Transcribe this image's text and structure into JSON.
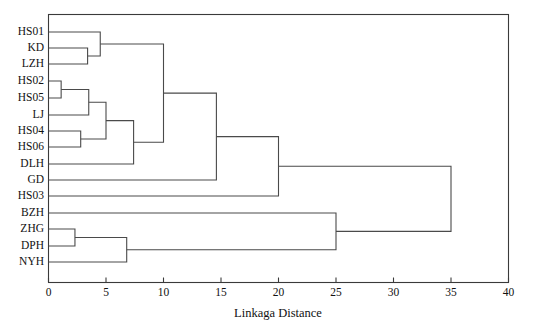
{
  "chart_data": {
    "type": "dendrogram",
    "title": "",
    "xlabel": "Linkaga Distance",
    "ylabel": "",
    "xlim": [
      0,
      40
    ],
    "xticks": [
      0,
      5,
      10,
      15,
      20,
      25,
      30,
      35,
      40
    ],
    "xtick_labels": [
      "0",
      "5",
      "10",
      "15",
      "20",
      "25",
      "30",
      "35",
      "40"
    ],
    "grid": false,
    "legend": null,
    "orientation": "horizontal",
    "leaves": [
      "HS01",
      "KD",
      "LZH",
      "HS02",
      "HS05",
      "LJ",
      "HS04",
      "HS06",
      "DLH",
      "GD",
      "HS03",
      "BZH",
      "ZHG",
      "DPH",
      "NYH"
    ],
    "merges": [
      {
        "id": "m1",
        "children": [
          "KD",
          "LZH"
        ],
        "distance": 3.4
      },
      {
        "id": "m2",
        "children": [
          "HS01",
          "m1"
        ],
        "distance": 4.5
      },
      {
        "id": "m3",
        "children": [
          "HS02",
          "HS05"
        ],
        "distance": 1.1
      },
      {
        "id": "m4",
        "children": [
          "m3",
          "LJ"
        ],
        "distance": 3.5
      },
      {
        "id": "m5",
        "children": [
          "HS04",
          "HS06"
        ],
        "distance": 2.8
      },
      {
        "id": "m6",
        "children": [
          "m4",
          "m5"
        ],
        "distance": 5.0
      },
      {
        "id": "m7",
        "children": [
          "m6",
          "DLH"
        ],
        "distance": 7.4
      },
      {
        "id": "m8",
        "children": [
          "m2",
          "m7"
        ],
        "distance": 10.0
      },
      {
        "id": "m9",
        "children": [
          "m8",
          "GD"
        ],
        "distance": 14.6
      },
      {
        "id": "m10",
        "children": [
          "m9",
          "HS03"
        ],
        "distance": 20.0
      },
      {
        "id": "m11",
        "children": [
          "ZHG",
          "DPH"
        ],
        "distance": 2.3
      },
      {
        "id": "m12",
        "children": [
          "m11",
          "NYH"
        ],
        "distance": 6.8
      },
      {
        "id": "m13",
        "children": [
          "BZH",
          "m12"
        ],
        "distance": 25.0
      },
      {
        "id": "m14",
        "children": [
          "m10",
          "m13"
        ],
        "distance": 35.0
      }
    ],
    "clusters_description": {
      "cluster_A": [
        "HS01",
        "KD",
        "LZH"
      ],
      "cluster_B": [
        "HS02",
        "HS05",
        "LJ",
        "HS04",
        "HS06",
        "DLH"
      ],
      "cluster_C": [
        "GD"
      ],
      "cluster_D": [
        "HS03"
      ],
      "cluster_E": [
        "BZH",
        "ZHG",
        "DPH",
        "NYH"
      ]
    }
  },
  "axis": {
    "x_title": "Linkaga Distance"
  }
}
